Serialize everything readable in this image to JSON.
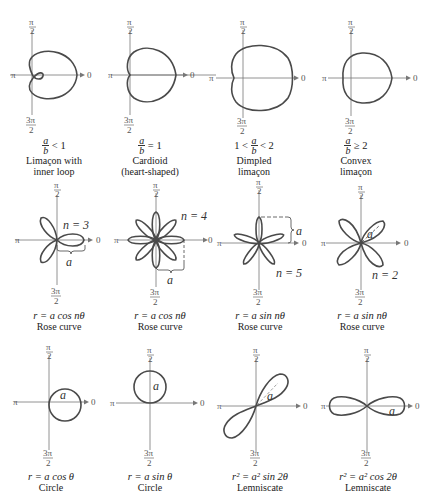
{
  "axis_labels": {
    "top": "π/2",
    "top_num": "π",
    "top_den": "2",
    "left": "π",
    "right": "0",
    "bottom_num": "3π",
    "bottom_den": "2"
  },
  "colors": {
    "curve": "#4a4a4a",
    "axis": "#777777",
    "text": "#222222",
    "background": "#ffffff"
  },
  "rows": [
    {
      "panels": [
        {
          "id": "limacon-inner-loop",
          "condition_pre": "",
          "frac_num": "a",
          "frac_den": "b",
          "condition_post": "< 1",
          "name_line1": "Limaçon with",
          "name_line2": "inner loop"
        },
        {
          "id": "cardioid",
          "condition_pre": "",
          "frac_num": "a",
          "frac_den": "b",
          "condition_post": "= 1",
          "name_line1": "Cardioid",
          "name_line2": "(heart-shaped)"
        },
        {
          "id": "dimpled-limacon",
          "condition_pre": "1 <",
          "frac_num": "a",
          "frac_den": "b",
          "condition_post": "< 2",
          "name_line1": "Dimpled",
          "name_line2": "limaçon"
        },
        {
          "id": "convex-limacon",
          "condition_pre": "",
          "frac_num": "a",
          "frac_den": "b",
          "condition_post": "≥ 2",
          "name_line1": "Convex",
          "name_line2": "limaçon"
        }
      ]
    },
    {
      "panels": [
        {
          "id": "rose-cos-n3",
          "equation": "r = a cos nθ",
          "name": "Rose curve",
          "n_label": "n = 3",
          "a_label": "a"
        },
        {
          "id": "rose-cos-n4",
          "equation": "r = a cos nθ",
          "name": "Rose curve",
          "n_label": "n = 4",
          "a_label": "a"
        },
        {
          "id": "rose-sin-n5",
          "equation": "r = a sin nθ",
          "name": "Rose curve",
          "n_label": "n = 5",
          "a_label": "a"
        },
        {
          "id": "rose-sin-n2",
          "equation": "r = a sin nθ",
          "name": "Rose curve",
          "n_label": "n = 2",
          "a_label": "a"
        }
      ]
    },
    {
      "panels": [
        {
          "id": "circle-cos",
          "equation": "r = a cos θ",
          "name": "Circle",
          "a_label": "a"
        },
        {
          "id": "circle-sin",
          "equation": "r = a sin θ",
          "name": "Circle",
          "a_label": "a"
        },
        {
          "id": "lemniscate-sin",
          "equation": "r² = a² sin 2θ",
          "name": "Lemniscate",
          "a_label": "a"
        },
        {
          "id": "lemniscate-cos",
          "equation": "r² = a² cos 2θ",
          "name": "Lemniscate",
          "a_label": "a"
        }
      ]
    }
  ]
}
